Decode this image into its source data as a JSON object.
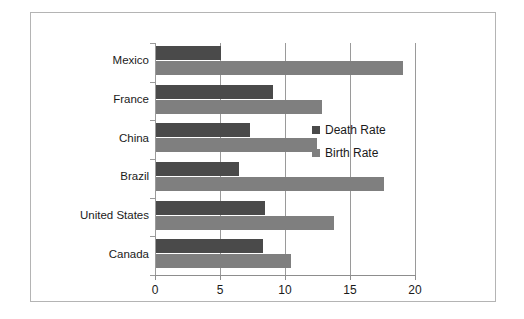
{
  "chart_data": {
    "type": "bar",
    "orientation": "horizontal",
    "title": "",
    "xlabel": "",
    "ylabel": "",
    "xlim": [
      0,
      20
    ],
    "xticks": [
      "0",
      "5",
      "10",
      "15",
      "20"
    ],
    "grid": true,
    "legend_position": "right",
    "categories": [
      "Mexico",
      "France",
      "China",
      "Brazil",
      "United States",
      "Canada"
    ],
    "series": [
      {
        "name": "Death Rate",
        "color": "#4a4a4a",
        "values": [
          5.0,
          9.0,
          7.2,
          6.4,
          8.4,
          8.2
        ]
      },
      {
        "name": "Birth Rate",
        "color": "#7f7f7f",
        "values": [
          19.0,
          12.8,
          12.4,
          17.5,
          13.7,
          10.4
        ]
      }
    ]
  },
  "legend": {
    "items": [
      {
        "label": "Death Rate",
        "color": "#4a4a4a"
      },
      {
        "label": "Birth Rate",
        "color": "#7f7f7f"
      }
    ]
  }
}
